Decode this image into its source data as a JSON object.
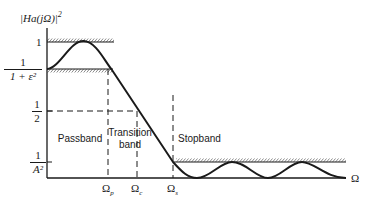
{
  "diagram": {
    "y_axis_label": "|H_a (jΩ)|²",
    "y_axis_label_text": "|Ha(jΩ)|",
    "y_axis_label_sup": "2",
    "x_axis_label": "Ω",
    "y_ticks": {
      "one": "1",
      "passband_edge": {
        "num": "1",
        "den": "1 + ε²"
      },
      "half": {
        "num": "1",
        "den": "2"
      },
      "stopband": {
        "num": "1",
        "den": "A²"
      }
    },
    "x_ticks": {
      "omega_p": "Ωp",
      "omega_c": "Ωc",
      "omega_s": "Ωs"
    },
    "regions": {
      "passband": "Passband",
      "transition_line1": "Transition",
      "transition_line2": "band",
      "stopband": "Stopband"
    },
    "colors": {
      "stroke": "#1a1a1a",
      "background": "#ffffff"
    }
  }
}
